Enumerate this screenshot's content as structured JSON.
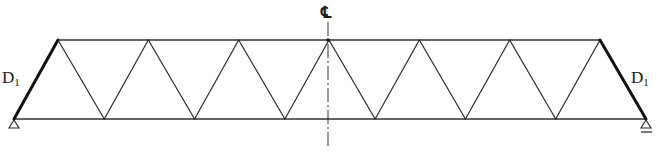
{
  "diagram": {
    "type": "warren-truss",
    "panels_top": 6,
    "panels_bottom": 7,
    "top_nodes": 7,
    "bottom_nodes": 8,
    "labels": {
      "left_end_diagonal": "D",
      "left_end_diagonal_sub": "1",
      "right_end_diagonal": "D",
      "right_end_diagonal_sub": "1",
      "centerline": "℄"
    },
    "supports": {
      "left": "pin-support",
      "right": "roller-support"
    },
    "highlighted_members": [
      "left-end-diagonal-D1",
      "right-end-diagonal-D1"
    ],
    "colors": {
      "line": "#2a2a2a",
      "highlight": "#111111",
      "background": "#ffffff"
    }
  }
}
